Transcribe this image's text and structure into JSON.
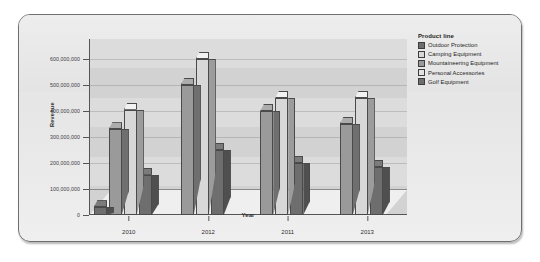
{
  "chart_data": {
    "type": "bar",
    "title": "",
    "xlabel": "Year",
    "ylabel": "Revenue",
    "categories": [
      "2010",
      "2012",
      "2011",
      "2013"
    ],
    "ylim": [
      0,
      600000000
    ],
    "yticks": [
      0,
      100000000,
      200000000,
      300000000,
      400000000,
      500000000,
      600000000
    ],
    "ytick_labels": [
      "0",
      "100,000,000",
      "200,000,000",
      "300,000,000",
      "400,000,000",
      "500,000,000",
      "600,000,000"
    ],
    "grid": true,
    "legend_position": "right",
    "legend_title": "Product line",
    "series": [
      {
        "name": "Outdoor Protection",
        "color": "#6e6e6e",
        "values": [
          30000000,
          0,
          0,
          0
        ]
      },
      {
        "name": "Camping Equipment",
        "color": "#c9c9c9",
        "values": [
          0,
          0,
          0,
          0
        ]
      },
      {
        "name": "Mountaineering Equipment",
        "color": "#9a9a9a",
        "values": [
          330000000,
          500000000,
          400000000,
          350000000
        ]
      },
      {
        "name": "Personal Accessories",
        "color": "#d8d8d8",
        "values": [
          405000000,
          600000000,
          450000000,
          450000000
        ]
      },
      {
        "name": "Golf Equipment",
        "color": "#6e6e6e",
        "values": [
          155000000,
          250000000,
          200000000,
          185000000
        ]
      }
    ]
  },
  "legend": {
    "title": "Product line",
    "items": [
      {
        "label": "Outdoor Protection",
        "color": "#6e6e6e"
      },
      {
        "label": "Camping Equipment",
        "color": "#d8d8d8"
      },
      {
        "label": "Mountaineering Equipment",
        "color": "#9a9a9a"
      },
      {
        "label": "Personal Accessories",
        "color": "#e2e2e2"
      },
      {
        "label": "Golf Equipment",
        "color": "#6e6e6e"
      }
    ]
  }
}
